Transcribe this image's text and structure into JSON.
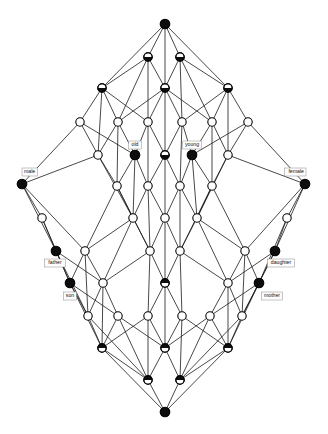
{
  "figure": {
    "type": "concept-lattice-hasse-diagram",
    "title": "",
    "background_color": "#ffffff",
    "edge_color": "#1a1a1a",
    "node_stroke_color": "#000000",
    "node_fill_black": "#0d0d0d",
    "node_fill_white": "#ffffff",
    "label_box_fill": "#fdfdfd",
    "label_box_stroke": "#8c8c8c"
  },
  "labels": {
    "attributes": [
      {
        "id": "male",
        "text": "male",
        "x": 24,
        "y": 172,
        "anchor": "start",
        "node": 8
      },
      {
        "id": "old",
        "text": "old",
        "x": 135,
        "y": 145,
        "anchor": "middle",
        "node": 17
      },
      {
        "id": "young",
        "text": "young",
        "x": 192,
        "y": 145,
        "anchor": "middle",
        "node": 19
      },
      {
        "id": "female",
        "text": "female",
        "x": 304,
        "y": 172,
        "anchor": "end",
        "node": 12
      }
    ],
    "objects": [
      {
        "id": "father",
        "text": "father",
        "x": 55,
        "y": 263,
        "anchor": "middle",
        "node": 26
      },
      {
        "id": "son",
        "text": "son",
        "x": 70,
        "y": 296,
        "anchor": "middle",
        "node": 33
      },
      {
        "id": "daughter",
        "text": "daughter",
        "x": 281,
        "y": 263,
        "anchor": "middle",
        "node": 31
      },
      {
        "id": "mother",
        "text": "mother",
        "x": 272,
        "y": 296,
        "anchor": "middle",
        "node": 37
      }
    ]
  },
  "chart_data": {
    "type": "diagram",
    "diagram_kind": "concept lattice (Hasse diagram)",
    "node_count": 50,
    "levels": [
      24,
      57,
      88,
      122,
      155,
      186,
      218,
      251,
      283,
      316,
      348,
      380,
      412
    ],
    "node_styles": {
      "full": "filled black circle (both object and attribute concept)",
      "half_bottom": "lower half black (attribute concept)",
      "half_top": "upper half black (object concept)",
      "empty": "white circle (plain concept)"
    },
    "nodes": [
      {
        "id": 0,
        "x": 165,
        "y": 24,
        "style": "full"
      },
      {
        "id": 1,
        "x": 148,
        "y": 57,
        "style": "half_bottom"
      },
      {
        "id": 2,
        "x": 180,
        "y": 57,
        "style": "half_bottom"
      },
      {
        "id": 3,
        "x": 102,
        "y": 88,
        "style": "half_bottom"
      },
      {
        "id": 4,
        "x": 165,
        "y": 88,
        "style": "half_bottom"
      },
      {
        "id": 5,
        "x": 228,
        "y": 88,
        "style": "half_bottom"
      },
      {
        "id": 6,
        "x": 80,
        "y": 122,
        "style": "empty"
      },
      {
        "id": 7,
        "x": 118,
        "y": 122,
        "style": "empty"
      },
      {
        "id": 8,
        "x": 148,
        "y": 122,
        "style": "empty"
      },
      {
        "id": 9,
        "x": 182,
        "y": 122,
        "style": "empty"
      },
      {
        "id": 10,
        "x": 212,
        "y": 122,
        "style": "empty"
      },
      {
        "id": 11,
        "x": 248,
        "y": 122,
        "style": "empty"
      },
      {
        "id": 12,
        "x": 98,
        "y": 155,
        "style": "empty"
      },
      {
        "id": 13,
        "x": 135,
        "y": 155,
        "style": "full"
      },
      {
        "id": 14,
        "x": 165,
        "y": 155,
        "style": "half_bottom"
      },
      {
        "id": 15,
        "x": 192,
        "y": 155,
        "style": "full"
      },
      {
        "id": 16,
        "x": 228,
        "y": 155,
        "style": "empty"
      },
      {
        "id": 17,
        "x": 22,
        "y": 184,
        "style": "full"
      },
      {
        "id": 18,
        "x": 117,
        "y": 186,
        "style": "empty"
      },
      {
        "id": 19,
        "x": 148,
        "y": 186,
        "style": "empty"
      },
      {
        "id": 20,
        "x": 180,
        "y": 186,
        "style": "empty"
      },
      {
        "id": 21,
        "x": 212,
        "y": 186,
        "style": "empty"
      },
      {
        "id": 22,
        "x": 305,
        "y": 184,
        "style": "full"
      },
      {
        "id": 23,
        "x": 133,
        "y": 218,
        "style": "empty"
      },
      {
        "id": 24,
        "x": 165,
        "y": 218,
        "style": "empty"
      },
      {
        "id": 25,
        "x": 197,
        "y": 218,
        "style": "empty"
      },
      {
        "id": 26,
        "x": 42,
        "y": 218,
        "style": "empty"
      },
      {
        "id": 27,
        "x": 287,
        "y": 218,
        "style": "empty"
      },
      {
        "id": 28,
        "x": 56,
        "y": 251,
        "style": "full"
      },
      {
        "id": 29,
        "x": 85,
        "y": 251,
        "style": "empty"
      },
      {
        "id": 30,
        "x": 150,
        "y": 251,
        "style": "empty"
      },
      {
        "id": 31,
        "x": 180,
        "y": 251,
        "style": "empty"
      },
      {
        "id": 32,
        "x": 245,
        "y": 251,
        "style": "empty"
      },
      {
        "id": 33,
        "x": 275,
        "y": 251,
        "style": "full"
      },
      {
        "id": 34,
        "x": 70,
        "y": 283,
        "style": "full"
      },
      {
        "id": 35,
        "x": 103,
        "y": 283,
        "style": "empty"
      },
      {
        "id": 36,
        "x": 165,
        "y": 283,
        "style": "half_top"
      },
      {
        "id": 37,
        "x": 228,
        "y": 283,
        "style": "empty"
      },
      {
        "id": 38,
        "x": 259,
        "y": 283,
        "style": "full"
      },
      {
        "id": 39,
        "x": 88,
        "y": 316,
        "style": "empty"
      },
      {
        "id": 40,
        "x": 118,
        "y": 316,
        "style": "empty"
      },
      {
        "id": 41,
        "x": 148,
        "y": 316,
        "style": "empty"
      },
      {
        "id": 42,
        "x": 182,
        "y": 316,
        "style": "empty"
      },
      {
        "id": 43,
        "x": 210,
        "y": 316,
        "style": "empty"
      },
      {
        "id": 44,
        "x": 242,
        "y": 316,
        "style": "empty"
      },
      {
        "id": 45,
        "x": 102,
        "y": 348,
        "style": "half_top"
      },
      {
        "id": 46,
        "x": 165,
        "y": 348,
        "style": "half_top"
      },
      {
        "id": 47,
        "x": 228,
        "y": 348,
        "style": "half_top"
      },
      {
        "id": 48,
        "x": 148,
        "y": 380,
        "style": "half_top"
      },
      {
        "id": 49,
        "x": 180,
        "y": 380,
        "style": "half_top"
      },
      {
        "id": 50,
        "x": 165,
        "y": 412,
        "style": "full"
      }
    ],
    "edges": [
      [
        0,
        1
      ],
      [
        0,
        2
      ],
      [
        0,
        3
      ],
      [
        0,
        5
      ],
      [
        0,
        4
      ],
      [
        1,
        3
      ],
      [
        1,
        4
      ],
      [
        1,
        7
      ],
      [
        1,
        8
      ],
      [
        2,
        4
      ],
      [
        2,
        5
      ],
      [
        2,
        9
      ],
      [
        2,
        10
      ],
      [
        3,
        6
      ],
      [
        3,
        7
      ],
      [
        3,
        8
      ],
      [
        3,
        12
      ],
      [
        4,
        8
      ],
      [
        4,
        9
      ],
      [
        4,
        14
      ],
      [
        4,
        7
      ],
      [
        4,
        10
      ],
      [
        5,
        9
      ],
      [
        5,
        10
      ],
      [
        5,
        11
      ],
      [
        5,
        16
      ],
      [
        6,
        12
      ],
      [
        6,
        17
      ],
      [
        6,
        13
      ],
      [
        7,
        12
      ],
      [
        7,
        13
      ],
      [
        7,
        18
      ],
      [
        8,
        13
      ],
      [
        8,
        14
      ],
      [
        8,
        19
      ],
      [
        9,
        14
      ],
      [
        9,
        15
      ],
      [
        9,
        20
      ],
      [
        10,
        15
      ],
      [
        10,
        16
      ],
      [
        10,
        21
      ],
      [
        11,
        16
      ],
      [
        11,
        22
      ],
      [
        11,
        15
      ],
      [
        12,
        17
      ],
      [
        12,
        18
      ],
      [
        12,
        23
      ],
      [
        13,
        18
      ],
      [
        13,
        19
      ],
      [
        13,
        23
      ],
      [
        14,
        19
      ],
      [
        14,
        20
      ],
      [
        14,
        24
      ],
      [
        15,
        20
      ],
      [
        15,
        21
      ],
      [
        15,
        25
      ],
      [
        16,
        21
      ],
      [
        16,
        22
      ],
      [
        16,
        25
      ],
      [
        17,
        26
      ],
      [
        17,
        28
      ],
      [
        17,
        29
      ],
      [
        18,
        23
      ],
      [
        18,
        29
      ],
      [
        18,
        30
      ],
      [
        19,
        23
      ],
      [
        19,
        24
      ],
      [
        19,
        30
      ],
      [
        20,
        24
      ],
      [
        20,
        25
      ],
      [
        20,
        31
      ],
      [
        21,
        25
      ],
      [
        21,
        31
      ],
      [
        21,
        32
      ],
      [
        22,
        27
      ],
      [
        22,
        32
      ],
      [
        22,
        33
      ],
      [
        23,
        29
      ],
      [
        23,
        30
      ],
      [
        23,
        35
      ],
      [
        24,
        30
      ],
      [
        24,
        31
      ],
      [
        24,
        36
      ],
      [
        25,
        31
      ],
      [
        25,
        32
      ],
      [
        25,
        37
      ],
      [
        26,
        28
      ],
      [
        26,
        34
      ],
      [
        27,
        33
      ],
      [
        27,
        38
      ],
      [
        28,
        34
      ],
      [
        28,
        35
      ],
      [
        28,
        39
      ],
      [
        29,
        34
      ],
      [
        29,
        35
      ],
      [
        29,
        39
      ],
      [
        30,
        35
      ],
      [
        30,
        36
      ],
      [
        30,
        41
      ],
      [
        31,
        36
      ],
      [
        31,
        37
      ],
      [
        31,
        42
      ],
      [
        32,
        37
      ],
      [
        32,
        38
      ],
      [
        32,
        44
      ],
      [
        33,
        38
      ],
      [
        33,
        37
      ],
      [
        33,
        44
      ],
      [
        34,
        39
      ],
      [
        34,
        40
      ],
      [
        34,
        45
      ],
      [
        35,
        39
      ],
      [
        35,
        40
      ],
      [
        35,
        45
      ],
      [
        36,
        41
      ],
      [
        36,
        42
      ],
      [
        36,
        46
      ],
      [
        37,
        43
      ],
      [
        37,
        44
      ],
      [
        37,
        47
      ],
      [
        38,
        43
      ],
      [
        38,
        44
      ],
      [
        38,
        47
      ],
      [
        39,
        45
      ],
      [
        39,
        48
      ],
      [
        40,
        45
      ],
      [
        40,
        46
      ],
      [
        40,
        48
      ],
      [
        41,
        45
      ],
      [
        41,
        46
      ],
      [
        41,
        48
      ],
      [
        42,
        46
      ],
      [
        42,
        47
      ],
      [
        42,
        49
      ],
      [
        43,
        46
      ],
      [
        43,
        47
      ],
      [
        43,
        49
      ],
      [
        44,
        47
      ],
      [
        44,
        49
      ],
      [
        45,
        48
      ],
      [
        45,
        50
      ],
      [
        46,
        48
      ],
      [
        46,
        49
      ],
      [
        47,
        49
      ],
      [
        47,
        50
      ],
      [
        48,
        50
      ],
      [
        49,
        50
      ]
    ]
  }
}
